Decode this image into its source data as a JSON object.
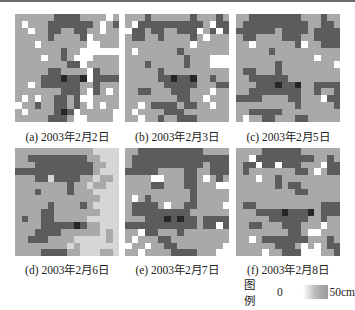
{
  "figure": {
    "panels": [
      {
        "label": "(a) 2003年2月2日",
        "rows": [
          "mmmmmmddddmmmmwm",
          "mwmmmdddddddmwmd",
          "mmwmmddmmddmmwmm",
          "mmmmmdmmmmdwmmmm",
          "mmmwmmmmmmmwwmmm",
          "mmmmmmmdmmwwwwww",
          "mmmmwmmdmwwwmmmm",
          "mmmmmmmmddwmmmmm",
          "mmmmmddmmmmwdmmm",
          "mmmmdddkddkwdddd",
          "mmwmddddddmmdmmm",
          "mmmmmmmdddmwdmwm",
          "mwmwmmddmdwwmmmm",
          "wmmdmmddmdmwmwmm",
          "mwmmmmdkdwmmmmmw",
          "mmmmmdddmwwmmmmw"
        ]
      },
      {
        "label": "(b) 2003年2月3日",
        "rows": [
          "mmmdmmmmmmdmmmdm",
          "mwddddddddddmwdd",
          "wddmddmmdddwmdwd",
          "mddmmdmmmmdmwmmm",
          "mmmmmmmmmmwmmmmm",
          "mwmmmmmmdmmmmmmm",
          "mmmmmmmmmdmmmwww",
          "mmmdmmmmmdmmmwww",
          "mmmmmdmmmmmmmmmm",
          "mmmmmddkddkmmdmm",
          "mmmmmmdddddmmmdd",
          "mmddmmmdddmmmwmm",
          "mmmmmmmmddmmwmmm",
          "mmwmddddmddmmwmm",
          "mwmmmmdddmmmmmmm",
          "mmwmmdmmdddmmmmm"
        ]
      },
      {
        "label": "(c) 2003年2月5日",
        "rows": [
          "mmddddddddmmmdmm",
          "mddddddddddmmddm",
          "ddddddmddddmdddd",
          "mddmmmmdddmmdddd",
          "mmwmmmmmmdwmmddd",
          "mmmmmdmmmmmmmmmm",
          "mmmmmmmmmmmmwmmm",
          "mmmmmmdmmmmmmmmw",
          "mddmmmdmmmmmmmmm",
          "mmddddddmmmmmmmm",
          "mmmdddkddkmmdddd",
          "mmddddddddmmdmmd",
          "ddddmmmmddmmmwdd",
          "mmmmmmmmmdmmmmmd",
          "mmdddddmmmmmmmmm",
          "mwmmddmmmddmmmmm"
        ]
      },
      {
        "label": "(d) 2003年2月6日",
        "rows": [
          "mmmmmmmmmmmmllll",
          "mmdddddddddmmlll",
          "mmmdddddddddmmll",
          "ddddddddddddmlll",
          "mmmddlddddmmlmml",
          "mmmmmmmmdmmlmmll",
          "mmmdmmmmdmmmllll",
          "mmmmmmmmmmmmmlll",
          "mmmmmdmmmmdmllll",
          "mmmmddmmmmmmmlll",
          "mdmmddmmmmmlllll",
          "mmmmdddddkdmmlll",
          "mmmddddmmmmmmlml",
          "mmdddmmmmlllllml",
          "mmmmmmmmlmllllll",
          "mmmmddddmmlllmml"
        ]
      },
      {
        "label": "(e) 2003年2月7日",
        "rows": [
          "mmddddddddddmmmm",
          "mddddddddddddddd",
          "mdddddddddddmddd",
          "dddddmmmmddmmddd",
          "mmmmwwmmmddmwmdm",
          "mmmmddmmmddmmmww",
          "mmmmmmmmmmdmmmmm",
          "mwmdmmmmmmdmmmmm",
          "mddddmwmmddmmmmw",
          "mdddddddddmmmmmm",
          "mmmdddkdkddmdddd",
          "dddddddddddmddwd",
          "mmwddmmmdmmmmmmm",
          "mwmmmddmmmmmmmmm",
          "wmmwmmddmmmmmmmw",
          "mmwmmmmddddmmmww"
        ]
      },
      {
        "label": "(f) 2003年2月8日",
        "rows": [
          "mmmmddddddmmmmmm",
          "mmwdddddddddmmdm",
          "mddwddwdddmmmwdd",
          "mdmmmmmmmddmwmdd",
          "mmmwmmdmmmmmmmmm",
          "mmmmmmdmddmmmmmm",
          "mmmmmmmmmddmmmmm",
          "mmmmmmmmmmmmmmmm",
          "mddmmmmmmmmmmddd",
          "mmmddddkdddkmddd",
          "mmmmmddddddmmdmm",
          "mmddmmmdddmmmwmm",
          "mmmmmmmmddmwwmmm",
          "mmwmdddddddmmmdm",
          "mmmmmmdddmwmwmdd",
          "mmmmwmmdddwwwmmd"
        ]
      }
    ]
  },
  "legend": {
    "title": "图例",
    "min_label": "0",
    "max_label": "50cm"
  }
}
